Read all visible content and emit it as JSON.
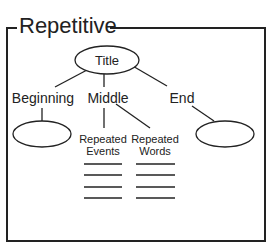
{
  "diagram": {
    "frame_title": "Repetitive",
    "root": {
      "label": "Title"
    },
    "branches": [
      {
        "label": "Beginning"
      },
      {
        "label": "Middle"
      },
      {
        "label": "End"
      }
    ],
    "middle_children": [
      {
        "line1": "Repeated",
        "line2": "Events"
      },
      {
        "line1": "Repeated",
        "line2": "Words"
      }
    ],
    "colors": {
      "stroke": "#222222",
      "background": "#ffffff"
    }
  }
}
